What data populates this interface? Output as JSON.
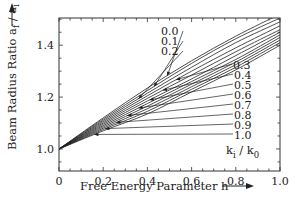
{
  "chart_data": {
    "type": "line",
    "title": "",
    "xlabel": "Free Energy Parameter  h",
    "ylabel": "Beam Radius Ratio  a_f / a_i",
    "xlim": [
      0,
      1.0
    ],
    "ylim": [
      0.915,
      1.505
    ],
    "x_ticks": [
      "0",
      "0.2",
      "0.4",
      "0.6",
      "0.8",
      "1.0"
    ],
    "y_ticks": [
      "1.0",
      "1.2",
      "1.4"
    ],
    "grid": false,
    "legend_title": "k_i / k_0",
    "x": [
      0,
      0.2,
      0.4,
      0.6,
      0.8,
      1.0
    ],
    "series": [
      {
        "name": "0.0",
        "values": [
          1.0,
          1.12,
          1.235,
          1.34,
          1.435,
          1.52
        ]
      },
      {
        "name": "0.1",
        "values": [
          1.0,
          1.115,
          1.225,
          1.33,
          1.425,
          1.505
        ]
      },
      {
        "name": "0.2",
        "values": [
          1.0,
          1.11,
          1.215,
          1.315,
          1.41,
          1.49
        ]
      },
      {
        "name": "0.3",
        "values": [
          1.0,
          1.105,
          1.205,
          1.3,
          1.39,
          1.475
        ]
      },
      {
        "name": "0.4",
        "values": [
          1.0,
          1.1,
          1.195,
          1.285,
          1.375,
          1.46
        ]
      },
      {
        "name": "0.5",
        "values": [
          1.0,
          1.095,
          1.185,
          1.27,
          1.36,
          1.45
        ]
      },
      {
        "name": "0.6",
        "values": [
          1.0,
          1.09,
          1.175,
          1.26,
          1.345,
          1.44
        ]
      },
      {
        "name": "0.7",
        "values": [
          1.0,
          1.085,
          1.165,
          1.25,
          1.335,
          1.43
        ]
      },
      {
        "name": "0.8",
        "values": [
          1.0,
          1.08,
          1.155,
          1.24,
          1.325,
          1.42
        ]
      },
      {
        "name": "0.9",
        "values": [
          1.0,
          1.075,
          1.145,
          1.23,
          1.315,
          1.41
        ]
      },
      {
        "name": "1.0",
        "values": [
          1.0,
          1.07,
          1.135,
          1.22,
          1.305,
          1.4
        ]
      }
    ],
    "annotations": [
      {
        "text": "0.0",
        "pos": "top-left"
      },
      {
        "text": "0.1",
        "pos": "top-left"
      },
      {
        "text": "0.2",
        "pos": "top-left"
      },
      {
        "text": "0.3",
        "pos": "right"
      },
      {
        "text": "0.4",
        "pos": "right"
      },
      {
        "text": "0.5",
        "pos": "right"
      },
      {
        "text": "0.6",
        "pos": "right"
      },
      {
        "text": "0.7",
        "pos": "right"
      },
      {
        "text": "0.8",
        "pos": "right"
      },
      {
        "text": "0.9",
        "pos": "right"
      },
      {
        "text": "1.0",
        "pos": "right"
      }
    ]
  },
  "labels": {
    "xlabel": "Free Energy Parameter  h",
    "ylabel": "Beam Radius Ratio  a",
    "ylabel_sub1": "f",
    "ylabel_slash": " / a",
    "ylabel_sub2": "i",
    "legend_k": "k",
    "legend_sub_i": "i",
    "legend_slash": " / k",
    "legend_sub_0": "0"
  }
}
